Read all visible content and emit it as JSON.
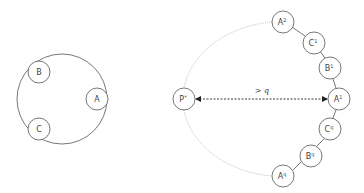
{
  "left_cycle": {
    "nodes": [
      {
        "id": "B",
        "label": "B",
        "sup": ""
      },
      {
        "id": "A",
        "label": "A",
        "sup": ""
      },
      {
        "id": "C",
        "label": "C",
        "sup": ""
      }
    ]
  },
  "right_cycle": {
    "nodes": [
      {
        "id": "A2",
        "label": "A",
        "sup": "2"
      },
      {
        "id": "C1",
        "label": "C",
        "sup": "1"
      },
      {
        "id": "B1",
        "label": "B",
        "sup": "1"
      },
      {
        "id": "A1",
        "label": "A",
        "sup": "1"
      },
      {
        "id": "Cq",
        "label": "C",
        "sup": "q"
      },
      {
        "id": "Bq",
        "label": "B",
        "sup": "q"
      },
      {
        "id": "Aq",
        "label": "A",
        "sup": "q"
      },
      {
        "id": "Pstar",
        "label": "P",
        "sup": "*"
      }
    ],
    "distance_label": "> q"
  },
  "colors": {
    "stroke": "#555555",
    "dotted": "#bbbbbb",
    "node_fill": "#ffffff"
  }
}
